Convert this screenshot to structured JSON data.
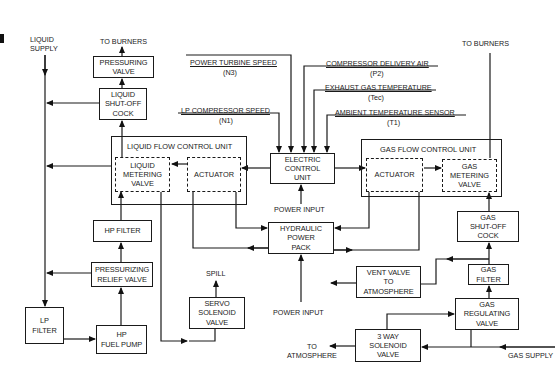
{
  "diagram": {
    "liquid_side": {
      "liquid_supply": "LIQUID SUPPLY",
      "to_burners": "TO BURNERS",
      "pressuring_valve": "PRESSURING VALVE",
      "liquid_shutoff_cock": "LIQUID SHUT-OFF COCK",
      "flow_control_unit": "LIQUID FLOW CONTROL UNIT",
      "metering_valve": "LIQUID METERING VALVE",
      "actuator": "ACTUATOR",
      "hp_filter": "HP FILTER",
      "pressurizing_relief_valve": "PRESSURIZING RELIEF VALVE",
      "lp_filter": "LP FILTER",
      "hp_fuel_pump": "HP FUEL PUMP",
      "servo_solenoid_valve": "SERVO SOLENOID VALVE",
      "spill": "SPILL"
    },
    "control": {
      "electric_control_unit": "ELECTRIC CONTROL UNIT",
      "power_input_ecu": "POWER INPUT",
      "hydraulic_power_pack": "HYDRAULIC POWER PACK",
      "power_input_hpp": "POWER INPUT",
      "signals": [
        {
          "name": "POWER TURBINE SPEED",
          "symbol": "(N3)"
        },
        {
          "name": "LP COMPRESSOR SPEED",
          "symbol": "(N1)"
        },
        {
          "name": "COMPRESSOR DELIVERY AIR",
          "symbol": "(P2)"
        },
        {
          "name": "EXHAUST GAS TEMPERATURE",
          "symbol": "(Tec)"
        },
        {
          "name": "AMBIENT TEMPERATURE SENSOR",
          "symbol": "(T1)"
        }
      ]
    },
    "gas_side": {
      "to_burners": "TO BURNERS",
      "flow_control_unit": "GAS FLOW CONTROL UNIT",
      "actuator": "ACTUATOR",
      "metering_valve": "GAS METERING VALVE",
      "gas_shutoff_cock": "GAS SHUT-OFF COCK",
      "gas_filter": "GAS FILTER",
      "vent_valve": "VENT VALVE TO ATMOSPHERE",
      "gas_regulating_valve": "GAS REGULATING VALVE",
      "three_way_solenoid": "3 WAY SOLENOID VALVE",
      "to_atmosphere": "TO ATMOSPHERE",
      "gas_supply": "GAS SUPPLY"
    }
  }
}
